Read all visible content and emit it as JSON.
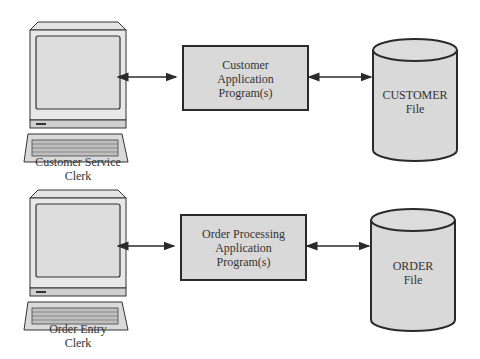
{
  "rows": [
    {
      "terminal_label_line1": "Customer Service",
      "terminal_label_line2": "Clerk",
      "program_line1": "Customer",
      "program_line2": "Application",
      "program_line3": "Program(s)",
      "file_line1": "CUSTOMER",
      "file_line2": "File"
    },
    {
      "terminal_label_line1": "Order Entry",
      "terminal_label_line2": "Clerk",
      "program_line1": "Order Processing",
      "program_line2": "Application",
      "program_line3": "Program(s)",
      "file_line1": "ORDER",
      "file_line2": "File"
    }
  ],
  "colors": {
    "fill": "#d9d9d9",
    "stroke": "#2a2a2a",
    "screen": "#dcdcdc"
  }
}
